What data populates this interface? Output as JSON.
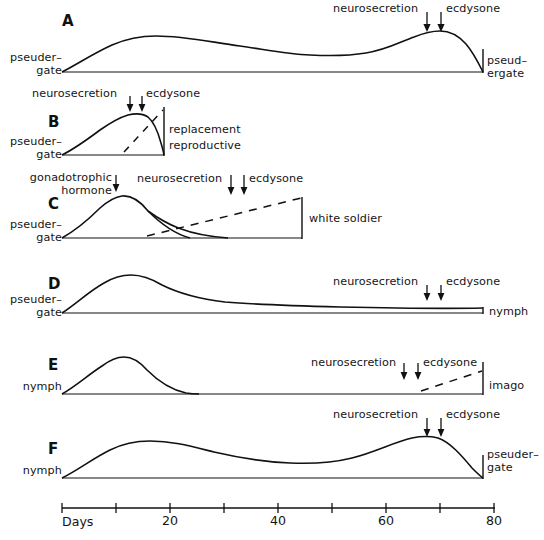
{
  "figure": {
    "title": "",
    "background_color": "#ffffff",
    "line_color": "#111111",
    "panel_letters": [
      "A",
      "B",
      "C",
      "D",
      "E",
      "F"
    ]
  },
  "axis": {
    "label": "Days",
    "ticks": [
      {
        "value": 0,
        "label": ""
      },
      {
        "value": 10,
        "label": ""
      },
      {
        "value": 20,
        "label": "20"
      },
      {
        "value": 30,
        "label": ""
      },
      {
        "value": 40,
        "label": "40"
      },
      {
        "value": 50,
        "label": ""
      },
      {
        "value": 60,
        "label": "60"
      },
      {
        "value": 70,
        "label": ""
      },
      {
        "value": 80,
        "label": "80"
      }
    ],
    "range": [
      0,
      80
    ]
  },
  "panels": [
    {
      "letter": "A",
      "start_label": "pseuder–\ngate",
      "start_label_line1": "pseuder–",
      "start_label_line2": "gate",
      "end_label_line1": "pseud–",
      "end_label_line2": "ergate",
      "arrows": [
        {
          "name": "neurosecretion",
          "label": "neurosecretion",
          "day": 67
        },
        {
          "name": "ecdysone",
          "label": "ecdysone",
          "day": 70
        }
      ],
      "dashed_label": "",
      "has_dashed_line": false
    },
    {
      "letter": "B",
      "start_label_line1": "pseuder–",
      "start_label_line2": "gate",
      "end_label_line1": "replacement",
      "end_label_line2": "reproductive",
      "arrows": [
        {
          "name": "neurosecretion",
          "label": "neurosecretion",
          "day": 17
        },
        {
          "name": "ecdysone",
          "label": "ecdysone",
          "day": 20
        }
      ],
      "has_dashed_line": true
    },
    {
      "letter": "C",
      "start_label_line1": "pseuder–",
      "start_label_line2": "gate",
      "end_label_line1": "white soldier",
      "end_label_line2": "",
      "arrows": [
        {
          "name": "gonadotrophic-hormone",
          "label": "gonadotrophic\nhormone",
          "day": 10
        },
        {
          "name": "neurosecretion",
          "label": "neurosecretion",
          "day": 31
        },
        {
          "name": "ecdysone",
          "label": "ecdysone",
          "day": 33
        }
      ],
      "has_dashed_line": true
    },
    {
      "letter": "D",
      "start_label_line1": "pseuder–",
      "start_label_line2": "gate",
      "end_label_line1": "nymph",
      "end_label_line2": "",
      "arrows": [
        {
          "name": "neurosecretion",
          "label": "neurosecretion",
          "day": 67
        },
        {
          "name": "ecdysone",
          "label": "ecdysone",
          "day": 70
        }
      ],
      "has_dashed_line": false
    },
    {
      "letter": "E",
      "start_label_line1": "nymph",
      "start_label_line2": "",
      "end_label_line1": "imago",
      "end_label_line2": "",
      "arrows": [
        {
          "name": "neurosecretion",
          "label": "neurosecretion",
          "day": 63
        },
        {
          "name": "ecdysone",
          "label": "ecdysone",
          "day": 65
        }
      ],
      "has_dashed_line": true
    },
    {
      "letter": "F",
      "start_label_line1": "nymph",
      "start_label_line2": "",
      "end_label_line1": "pseuder–",
      "end_label_line2": "gate",
      "arrows": [
        {
          "name": "neurosecretion",
          "label": "neurosecretion",
          "day": 67
        },
        {
          "name": "ecdysone",
          "label": "ecdysone",
          "day": 70
        }
      ],
      "has_dashed_line": false
    }
  ],
  "labels": {
    "neurosecretion": "neurosecretion",
    "ecdysone": "ecdysone",
    "gonadotrophic_line1": "gonadotrophic",
    "gonadotrophic_line2": "hormone",
    "pseuder_line1": "pseuder–",
    "pseuder_line2": "gate",
    "pseud_line1": "pseud–",
    "pseud_line2": "ergate",
    "replacement": "replacement",
    "reproductive": "reproductive",
    "white_soldier": "white soldier",
    "nymph": "nymph",
    "imago": "imago",
    "days": "Days",
    "tick20": "20",
    "tick40": "40",
    "tick60": "60",
    "tick80": "80"
  }
}
